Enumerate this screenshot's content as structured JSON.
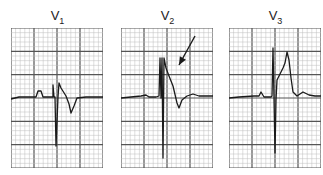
{
  "figure": {
    "leads": [
      {
        "id": "V1",
        "letter": "V",
        "sub": "1",
        "left": 11,
        "trace": "M0,71 L8,69 L25,69 L27,63 L30,63 L32,69 L42,69 L42,57 L43,69 L44,69 L45,118 L47,69 L48,55 L50,60 L55,68 L58,76 L60,85 L63,78 L66,70 L75,69 L92,69"
      },
      {
        "id": "V2",
        "letter": "V",
        "sub": "2",
        "left": 121,
        "trace": "M0,70 L10,69 L20,68 L25,67 L28,69 L35,69 L38,68 L39,30 L40,70 L41,30 L42,130 L43,30 L45,40 L48,48 L52,58 L56,75 L58,80 L61,72 L66,68 L72,66 L78,68 L92,68",
        "arrow": {
          "x1": 74,
          "y1": 8,
          "x2": 58,
          "y2": 37
        }
      },
      {
        "id": "V3",
        "letter": "V",
        "sub": "3",
        "left": 229,
        "trace": "M0,70 L10,69 L25,68 L30,68 L32,64 L35,69 L42,69 L43,68 L44,20 L45,70 L46,125 L47,72 L48,52 L52,44 L54,40 L56,35 L58,24 L60,32 L62,50 L64,64 L68,68 L74,64 L80,67 L86,68 L92,68"
      }
    ],
    "colors": {
      "minor_grid": "#bdbdbd",
      "major_grid": "#555555",
      "trace": "#1a1a1a",
      "background": "#ffffff"
    },
    "grid": {
      "major_cols": 4,
      "major_rows": 6,
      "minor_per_major": 5
    }
  }
}
